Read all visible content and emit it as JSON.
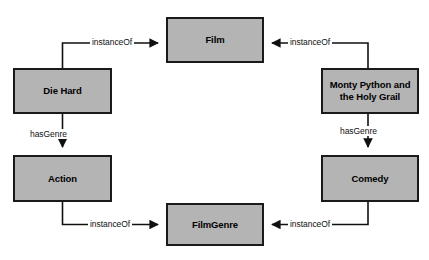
{
  "diagram": {
    "type": "node-link-graph",
    "background_color": "#ffffff",
    "node_fill_color": "#b4b4b4",
    "node_border_color": "#1a1a1a",
    "edge_color": "#111111",
    "nodes": [
      {
        "id": "film",
        "label": "Film",
        "x": 166,
        "y": 17,
        "w": 98,
        "h": 46
      },
      {
        "id": "die-hard",
        "label": "Die Hard",
        "x": 13,
        "y": 68,
        "w": 99,
        "h": 46
      },
      {
        "id": "monty",
        "label_line1": "Monty Python and",
        "label_line2": "the Holy Grail",
        "x": 321,
        "y": 68,
        "w": 98,
        "h": 46
      },
      {
        "id": "action",
        "label": "Action",
        "x": 13,
        "y": 155,
        "w": 99,
        "h": 47
      },
      {
        "id": "comedy",
        "label": "Comedy",
        "x": 321,
        "y": 155,
        "w": 98,
        "h": 47
      },
      {
        "id": "film-genre",
        "label": "FilmGenre",
        "x": 166,
        "y": 203,
        "w": 98,
        "h": 43
      }
    ],
    "edges": [
      {
        "id": "die-hard-instanceof-film",
        "from": "die-hard",
        "to": "film",
        "label": "instanceOf"
      },
      {
        "id": "monty-instanceof-film",
        "from": "monty",
        "to": "film",
        "label": "instanceOf"
      },
      {
        "id": "die-hard-hasgenre-action",
        "from": "die-hard",
        "to": "action",
        "label": "hasGenre"
      },
      {
        "id": "monty-hasgenre-comedy",
        "from": "monty",
        "to": "comedy",
        "label": "hasGenre"
      },
      {
        "id": "action-instanceof-genre",
        "from": "action",
        "to": "film-genre",
        "label": "instanceOf"
      },
      {
        "id": "comedy-instanceof-genre",
        "from": "comedy",
        "to": "film-genre",
        "label": "instanceOf"
      }
    ]
  }
}
